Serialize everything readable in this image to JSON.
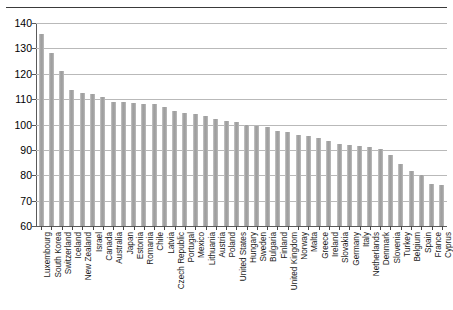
{
  "chart_data": {
    "type": "bar",
    "title": "",
    "subtitle": "",
    "xlabel": "",
    "ylabel": "",
    "ylim": [
      60,
      140
    ],
    "ytick_step": 10,
    "yticks": [
      140,
      130,
      120,
      110,
      100,
      90,
      80,
      70,
      60
    ],
    "grid": true,
    "legend": "none",
    "orientation": "vertical",
    "bar_color": "#9c9c9c",
    "categories": [
      "Luxembourg",
      "South Korea",
      "Switzerland",
      "Iceland",
      "New Zealand",
      "Israel",
      "Canada",
      "Australia",
      "Japan",
      "Estonia",
      "Romania",
      "Chile",
      "Latvia",
      "Czech Republic",
      "Portugal",
      "Mexico",
      "Lithuania",
      "Austria",
      "Poland",
      "United States",
      "Hungary",
      "Sweden",
      "Bulgaria",
      "Finland",
      "United Kingdom",
      "Norway",
      "Malta",
      "Greece",
      "Ireland",
      "Slovakia",
      "Germany",
      "Italy",
      "Netherlands",
      "Denmark",
      "Slovenia",
      "Turkey",
      "Belgium",
      "Spain",
      "France",
      "Cyprus"
    ],
    "values": [
      135.5,
      128.0,
      121.0,
      113.5,
      112.5,
      112.0,
      111.0,
      109.0,
      109.0,
      108.5,
      108.0,
      108.0,
      107.0,
      105.5,
      104.5,
      104.0,
      103.5,
      102.0,
      101.5,
      101.0,
      100.0,
      99.5,
      99.0,
      97.5,
      97.0,
      96.0,
      95.5,
      94.5,
      93.5,
      92.5,
      92.0,
      91.5,
      91.0,
      90.5,
      88.0,
      84.5,
      81.5,
      80.0,
      76.5,
      76.0
    ]
  }
}
